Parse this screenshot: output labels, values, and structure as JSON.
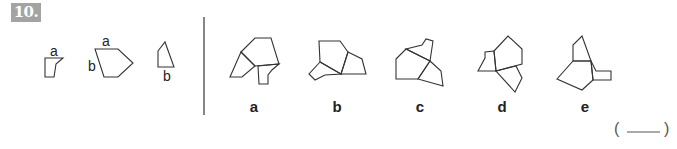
{
  "question": {
    "number_label": "10."
  },
  "given_pieces": [
    {
      "id": "piece-1",
      "labels": [
        {
          "text": "a",
          "x": 50,
          "y": 56
        }
      ],
      "polygons": [
        "45,58 63,58 56,64 54,77 45,77"
      ]
    },
    {
      "id": "piece-2",
      "labels": [
        {
          "text": "a",
          "x": 102,
          "y": 46
        },
        {
          "text": "b",
          "x": 88,
          "y": 71
        }
      ],
      "polygons": [
        "95,49 118,49 133,63 118,77 104,77"
      ]
    },
    {
      "id": "piece-3",
      "labels": [
        {
          "text": "b",
          "x": 163,
          "y": 81
        }
      ],
      "polygons": [
        "158,51 165,42 174,67 158,67"
      ]
    }
  ],
  "divider": {
    "x": 204,
    "y1": 17,
    "y2": 115
  },
  "options": [
    {
      "label": "a",
      "label_x": 254,
      "polygons": [
        "241,52 255,38 271,38 279,64 255,66",
        "241,52 230,77 242,77 255,66",
        "258,66 259,84 268,84 268,75 272,70 279,64"
      ]
    },
    {
      "label": "b",
      "label_x": 337,
      "polygons": [
        "319,41 340,41 348,52 341,74 320,62",
        "348,52 362,59 366,74 341,74",
        "320,62 309,74 315,80 325,75 341,74"
      ]
    },
    {
      "label": "c",
      "label_x": 420,
      "polygons": [
        "396,59 406,49 430,61 418,79 396,79",
        "406,49 422,45 426,39 433,41 430,61",
        "430,61 441,71 443,86 418,79"
      ]
    },
    {
      "label": "d",
      "label_x": 502,
      "polygons": [
        "494,51 508,36 522,49 522,64 496,71",
        "494,51 485,52 485,58 478,71 496,71",
        "496,71 516,66 522,78 515,92"
      ]
    },
    {
      "label": "e",
      "label_x": 585,
      "polygons": [
        "573,61 573,45 582,36 591,61",
        "573,61 591,61 593,80 582,90 557,79",
        "591,61 596,71 611,71 611,80 593,80"
      ]
    }
  ],
  "option_label_y": 112,
  "answer": {
    "open_paren": "(",
    "close_paren": ")",
    "value": ""
  }
}
